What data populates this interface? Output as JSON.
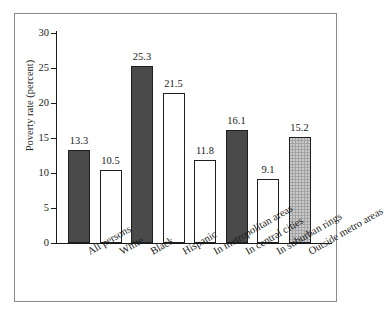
{
  "chart_data": {
    "type": "bar",
    "title": "",
    "subtitle": "",
    "xlabel": "",
    "ylabel": "Poverty rate (percent)",
    "ylim": [
      0,
      30
    ],
    "ytick_values": [
      30,
      25,
      20,
      15,
      10,
      5,
      0
    ],
    "ytick_labels": [
      "30",
      "25",
      "20",
      "15",
      "10",
      "5",
      "0"
    ],
    "grid": false,
    "legend": null,
    "categories": [
      "All persons",
      "White",
      "Black",
      "Hispanic",
      "In metropolitan areas",
      "In central cities",
      "In suburban rings",
      "Outside metro areas"
    ],
    "values": [
      13.3,
      10.5,
      25.3,
      21.5,
      11.8,
      16.1,
      9.1,
      15.2
    ],
    "value_labels": [
      "13.3",
      "10.5",
      "25.3",
      "21.5",
      "11.8",
      "16.1",
      "9.1",
      "15.2"
    ],
    "bar_fills": [
      "dark",
      "white",
      "dark",
      "white",
      "white",
      "dark",
      "white",
      "gray"
    ],
    "colors": {
      "dark": "#4a4a4a",
      "white": "#ffffff",
      "gray": "#a3a3a3",
      "outline": "#1f1f1f",
      "axis": "#1a1a1a",
      "frame": "#8a8a8a",
      "background": "#ffffff"
    }
  }
}
